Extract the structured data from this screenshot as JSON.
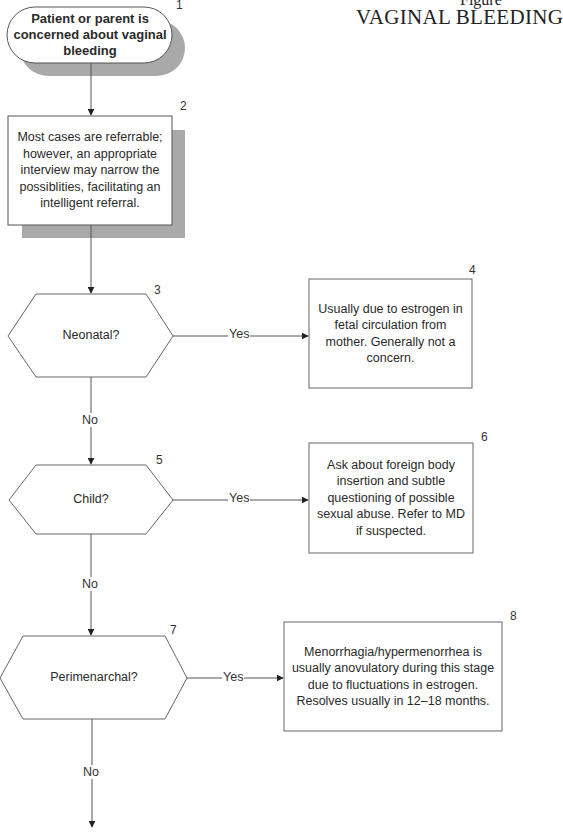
{
  "header": {
    "figure_label": "Figure",
    "title": "VAGINAL BLEEDING"
  },
  "nodes": [
    {
      "id": "1",
      "type": "terminal",
      "number": "1",
      "text": "Patient or parent is concerned about vaginal bleeding"
    },
    {
      "id": "2",
      "type": "process",
      "number": "2",
      "text": "Most cases are referrable; however, an appropriate interview may narrow the possiblities, facilitating an intelligent referral."
    },
    {
      "id": "3",
      "type": "decision",
      "number": "3",
      "text": "Neonatal?"
    },
    {
      "id": "4",
      "type": "process",
      "number": "4",
      "text": "Usually due to estrogen in fetal circulation from mother. Generally not a concern."
    },
    {
      "id": "5",
      "type": "decision",
      "number": "5",
      "text": "Child?"
    },
    {
      "id": "6",
      "type": "process",
      "number": "6",
      "text": "Ask about foreign body insertion and subtle questioning of possible sexual abuse. Refer to MD if suspected."
    },
    {
      "id": "7",
      "type": "decision",
      "number": "7",
      "text": "Perimenarchal?"
    },
    {
      "id": "8",
      "type": "process",
      "number": "8",
      "text": "Menorrhagia/hypermenorrhea is usually anovulatory during this stage due to fluctuations in estrogen. Resolves usually in 12–18 months."
    }
  ],
  "edges": [
    {
      "from": "1",
      "to": "2",
      "label": ""
    },
    {
      "from": "2",
      "to": "3",
      "label": ""
    },
    {
      "from": "3",
      "to": "4",
      "label": "Yes"
    },
    {
      "from": "3",
      "to": "5",
      "label": "No"
    },
    {
      "from": "5",
      "to": "6",
      "label": "Yes"
    },
    {
      "from": "5",
      "to": "7",
      "label": "No"
    },
    {
      "from": "7",
      "to": "8",
      "label": "Yes"
    },
    {
      "from": "7",
      "to": "continue",
      "label": "No"
    }
  ],
  "colors": {
    "line": "#555555",
    "shadow": "#a9a9a9",
    "fill": "#ffffff"
  }
}
